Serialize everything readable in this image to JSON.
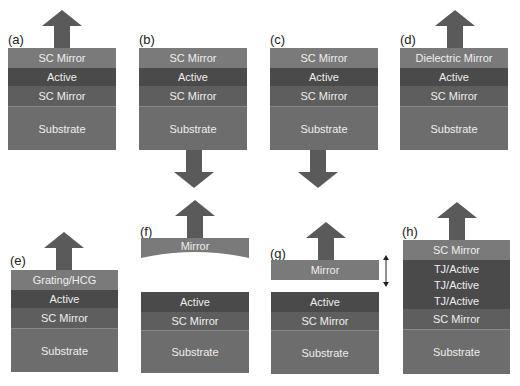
{
  "panels": {
    "a": {
      "label": "(a)",
      "layers": [
        "SC Mirror",
        "Active",
        "SC Mirror",
        "Substrate"
      ],
      "emission": "top"
    },
    "b": {
      "label": "(b)",
      "layers": [
        "SC Mirror",
        "Active",
        "SC Mirror",
        "Substrate"
      ],
      "emission": "bottom"
    },
    "c": {
      "label": "(c)",
      "layers": [
        "SC Mirror",
        "Active",
        "SC Mirror",
        "Substrate"
      ],
      "emission": "bottom"
    },
    "d": {
      "label": "(d)",
      "layers": [
        "Dielectric Mirror",
        "Active",
        "SC Mirror",
        "Substrate"
      ],
      "emission": "top"
    },
    "e": {
      "label": "(e)",
      "layers": [
        "Grating/HCG",
        "Active",
        "SC Mirror",
        "Substrate"
      ],
      "emission": "top"
    },
    "f": {
      "label": "(f)",
      "external_mirror": "Mirror",
      "layers": [
        "Active",
        "SC Mirror",
        "Substrate"
      ],
      "emission": "top",
      "mirror_shape": "curved"
    },
    "g": {
      "label": "(g)",
      "external_mirror": "Mirror",
      "layers": [
        "Active",
        "SC Mirror",
        "Substrate"
      ],
      "emission": "top",
      "mirror_movable": true
    },
    "h": {
      "label": "(h)",
      "layers": [
        "SC Mirror",
        "TJ/Active",
        "TJ/Active",
        "TJ/Active",
        "SC Mirror",
        "Substrate"
      ],
      "emission": "top"
    }
  },
  "colors": {
    "mirror": "#7a7a7a",
    "active": "#4a4a4a",
    "sc_mirror": "#5e5e5e",
    "substrate": "#6d6d6d",
    "arrow": "#5a5a5a"
  }
}
